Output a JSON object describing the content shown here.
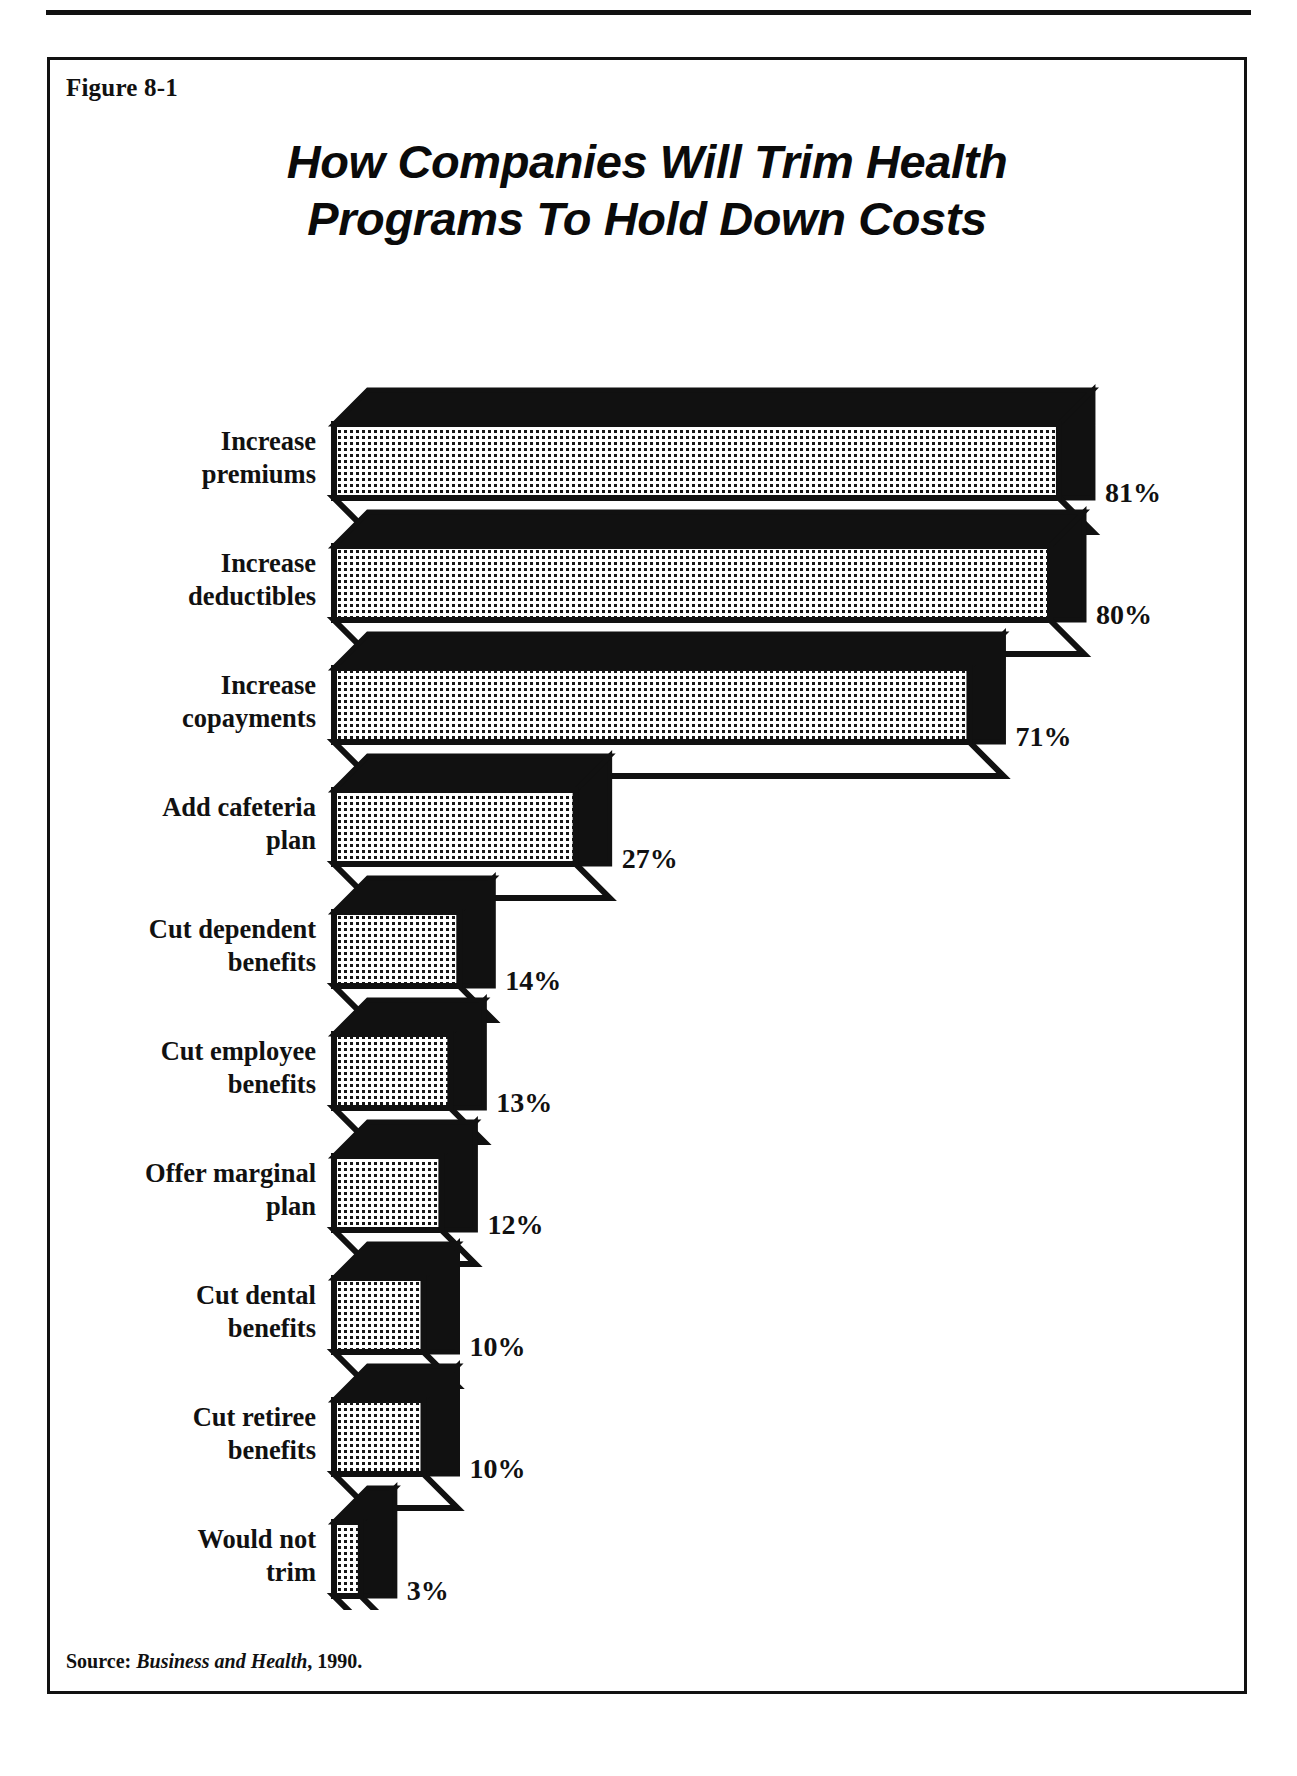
{
  "page": {
    "figure_label": "Figure 8-1",
    "title_line1": "How Companies Will Trim Health",
    "title_line2": "Programs To Hold Down Costs",
    "source_prefix": "Source:",
    "source_publication": "Business and Health",
    "source_suffix": ", 1990."
  },
  "chart_data": {
    "type": "bar",
    "orientation": "horizontal",
    "title": "How Companies Will Trim Health Programs To Hold Down Costs",
    "xlabel": "",
    "ylabel": "",
    "xlim": [
      0,
      100
    ],
    "grid": false,
    "legend": false,
    "value_suffix": "%",
    "categories": [
      "Increase premiums",
      "Increase deductibles",
      "Increase copayments",
      "Add cafeteria plan",
      "Cut dependent benefits",
      "Cut employee benefits",
      "Offer marginal plan",
      "Cut dental benefits",
      "Cut retiree benefits",
      "Would not trim"
    ],
    "values": [
      81,
      80,
      71,
      27,
      14,
      13,
      12,
      10,
      10,
      3
    ],
    "value_labels": [
      "81%",
      "80%",
      "71%",
      "27%",
      "14%",
      "13%",
      "12%",
      "10%",
      "10%",
      "3%"
    ],
    "category_lines": [
      [
        "Increase",
        "premiums"
      ],
      [
        "Increase",
        "deductibles"
      ],
      [
        "Increase",
        "copayments"
      ],
      [
        "Add cafeteria",
        "plan"
      ],
      [
        "Cut dependent",
        "benefits"
      ],
      [
        "Cut employee",
        "benefits"
      ],
      [
        "Offer marginal",
        "plan"
      ],
      [
        "Cut dental",
        "benefits"
      ],
      [
        "Cut retiree",
        "benefits"
      ],
      [
        "Would not",
        "trim"
      ]
    ],
    "colors": {
      "bar_face": "#ffffff",
      "bar_pattern": "#111111",
      "bar_shadow": "#111111",
      "outline": "#111111",
      "text": "#111111"
    }
  }
}
